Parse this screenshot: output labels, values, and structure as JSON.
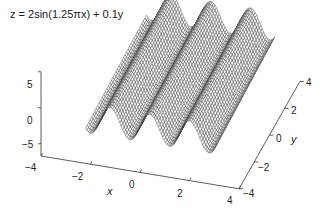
{
  "chart_data": {
    "type": "surface3d",
    "title": "z = 2sin(1.25πx) + 0.1y",
    "function": "z = 2*sin(1.25*pi*x) + 0.1*y",
    "render": "wireframe mesh",
    "xlabel": "x",
    "ylabel": "y",
    "zlabel": "",
    "xlim": [
      -4,
      4
    ],
    "ylim": [
      -4,
      4
    ],
    "zlim": [
      -5,
      5
    ],
    "xticks": [
      "-4",
      "-2",
      "0",
      "2",
      "4"
    ],
    "yticks": [
      "-4",
      "-2",
      "0",
      "2",
      "4"
    ],
    "zticks": [
      "5",
      "0",
      "-5"
    ],
    "surface_x_range": [
      -2.2,
      3.0
    ],
    "surface_y_range": [
      -4,
      4
    ],
    "grid": false,
    "line_color": "#444444"
  }
}
